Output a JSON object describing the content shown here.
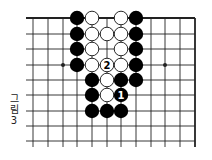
{
  "figure": {
    "caption_lines": [
      "그",
      "림",
      "3"
    ],
    "caption": "그림 3"
  },
  "board": {
    "columns": 12,
    "rows": 9,
    "col_x": [
      33,
      48,
      63,
      77,
      92,
      107,
      121,
      136,
      151,
      165,
      180,
      195
    ],
    "row_y": [
      18,
      34,
      49,
      65,
      80,
      95,
      111,
      126,
      141
    ],
    "edges": {
      "top": true,
      "right": true,
      "left": false,
      "bottom": false
    },
    "star_points": [
      [
        2,
        3
      ],
      [
        9,
        3
      ]
    ],
    "line_color": "#222222",
    "black_color": "#000000",
    "white_fill": "#ffffff",
    "stones": [
      {
        "col": 3,
        "row": 0,
        "color": "black"
      },
      {
        "col": 4,
        "row": 0,
        "color": "white"
      },
      {
        "col": 6,
        "row": 0,
        "color": "white"
      },
      {
        "col": 7,
        "row": 0,
        "color": "black"
      },
      {
        "col": 3,
        "row": 1,
        "color": "black"
      },
      {
        "col": 4,
        "row": 1,
        "color": "white"
      },
      {
        "col": 5,
        "row": 1,
        "color": "white"
      },
      {
        "col": 6,
        "row": 1,
        "color": "white"
      },
      {
        "col": 7,
        "row": 1,
        "color": "black"
      },
      {
        "col": 3,
        "row": 2,
        "color": "black"
      },
      {
        "col": 4,
        "row": 2,
        "color": "white"
      },
      {
        "col": 6,
        "row": 2,
        "color": "white"
      },
      {
        "col": 7,
        "row": 2,
        "color": "black"
      },
      {
        "col": 3,
        "row": 3,
        "color": "black"
      },
      {
        "col": 4,
        "row": 3,
        "color": "white"
      },
      {
        "col": 5,
        "row": 3,
        "color": "white",
        "label": "2"
      },
      {
        "col": 6,
        "row": 3,
        "color": "white"
      },
      {
        "col": 7,
        "row": 3,
        "color": "black"
      },
      {
        "col": 4,
        "row": 4,
        "color": "black"
      },
      {
        "col": 5,
        "row": 4,
        "color": "white"
      },
      {
        "col": 6,
        "row": 4,
        "color": "black"
      },
      {
        "col": 7,
        "row": 4,
        "color": "black"
      },
      {
        "col": 4,
        "row": 5,
        "color": "black"
      },
      {
        "col": 5,
        "row": 5,
        "color": "white"
      },
      {
        "col": 6,
        "row": 5,
        "color": "black",
        "label": "1"
      },
      {
        "col": 4,
        "row": 6,
        "color": "black"
      },
      {
        "col": 5,
        "row": 6,
        "color": "black"
      },
      {
        "col": 6,
        "row": 6,
        "color": "black"
      }
    ]
  }
}
